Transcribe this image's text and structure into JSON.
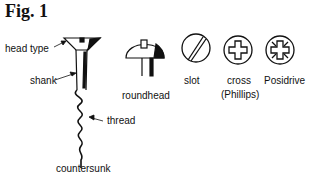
{
  "figure": {
    "title": "Fig. 1",
    "labels": {
      "head_type": "head type",
      "shank": "shank",
      "thread": "thread",
      "countersunk": "countersunk",
      "roundhead": "roundhead",
      "slot": "slot",
      "cross": "cross",
      "phillips": "(Phillips)",
      "posidrive": "Posidrive"
    },
    "icons": [
      "countersunk-screw-icon",
      "roundhead-screw-icon",
      "slot-head-icon",
      "cross-head-icon",
      "posidrive-head-icon"
    ]
  }
}
